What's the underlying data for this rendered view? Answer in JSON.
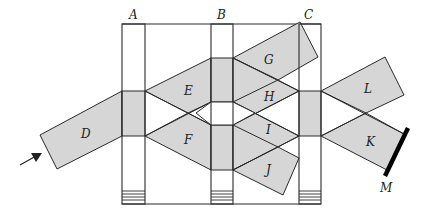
{
  "diagram": {
    "type": "optical beam-splitter interferometer schematic",
    "plates": [
      {
        "id": "A",
        "label": "A"
      },
      {
        "id": "B",
        "label": "B"
      },
      {
        "id": "C",
        "label": "C"
      }
    ],
    "beams": [
      {
        "id": "D",
        "label": "D"
      },
      {
        "id": "E",
        "label": "E"
      },
      {
        "id": "F",
        "label": "F"
      },
      {
        "id": "G",
        "label": "G"
      },
      {
        "id": "H",
        "label": "H"
      },
      {
        "id": "I",
        "label": "I"
      },
      {
        "id": "J",
        "label": "J"
      },
      {
        "id": "K",
        "label": "K"
      },
      {
        "id": "L",
        "label": "L"
      }
    ],
    "mirror": {
      "id": "M",
      "label": "M"
    },
    "colors": {
      "beam_fill": "#d6d6d6",
      "line": "#2a2a2a",
      "mirror": "#000000",
      "background": "#ffffff"
    }
  }
}
